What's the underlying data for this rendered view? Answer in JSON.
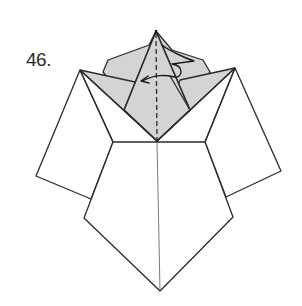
{
  "step": {
    "number_label": "46."
  },
  "diagram": {
    "colors": {
      "paper_white": "#ffffff",
      "paper_colored": "#d4d4d4",
      "line": "#2b2b2b"
    },
    "symbols": [
      "valley-fold-line",
      "fold-arrow"
    ]
  }
}
